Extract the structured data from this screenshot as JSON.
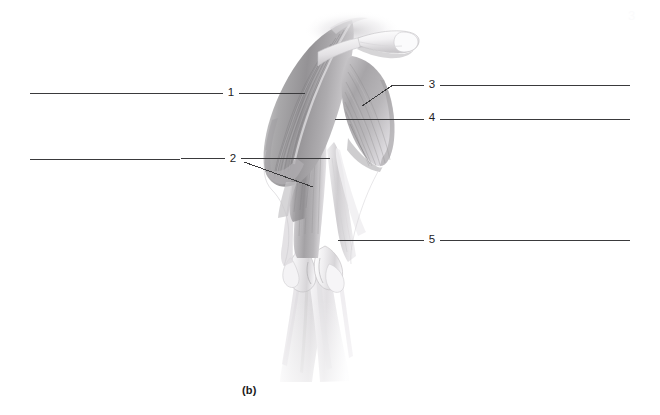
{
  "figure": {
    "caption": "(b)",
    "view": "posterior-shoulder-and-arm-musculature",
    "background_color": "#ffffff",
    "leader_line_color": "#3a3a3c",
    "label_text_color": "#1d1d1f",
    "corner_artifact": "3",
    "labels": [
      {
        "id": "label-1",
        "number": "1",
        "x": 231,
        "y": 93,
        "side": "left",
        "leaders": [
          {
            "points": "30,93 305,93"
          }
        ]
      },
      {
        "id": "label-2",
        "number": "2",
        "x": 233,
        "y": 159,
        "side": "left",
        "leaders": [
          {
            "points": "30,160 332,158"
          },
          {
            "points": "244,162 313,187"
          }
        ]
      },
      {
        "id": "label-3",
        "number": "3",
        "x": 432,
        "y": 85,
        "side": "right",
        "leaders": [
          {
            "points": "630,85 393,85"
          },
          {
            "points": "393,85 362,106"
          }
        ]
      },
      {
        "id": "label-4",
        "number": "4",
        "x": 432,
        "y": 118,
        "side": "right",
        "leaders": [
          {
            "points": "630,119 335,119"
          }
        ]
      },
      {
        "id": "label-5",
        "number": "5",
        "x": 432,
        "y": 240,
        "side": "right",
        "leaders": [
          {
            "points": "630,240 338,240"
          }
        ]
      }
    ]
  }
}
